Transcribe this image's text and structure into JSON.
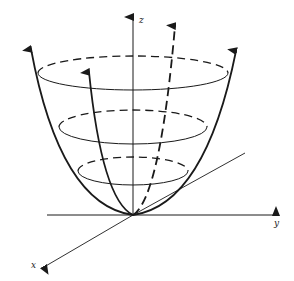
{
  "figure": {
    "axes": {
      "z_label": "z",
      "y_label": "y",
      "x_label": "x"
    },
    "level_curves": [
      {
        "name": "top",
        "cx": 133,
        "cy": 73,
        "rx": 95,
        "ry": 17
      },
      {
        "name": "middle",
        "cx": 133,
        "cy": 127,
        "rx": 74,
        "ry": 17
      },
      {
        "name": "bottom",
        "cx": 133,
        "cy": 171,
        "rx": 55,
        "ry": 14
      }
    ],
    "colors": {
      "stroke": "#1a1a1a",
      "background": "#ffffff"
    }
  }
}
